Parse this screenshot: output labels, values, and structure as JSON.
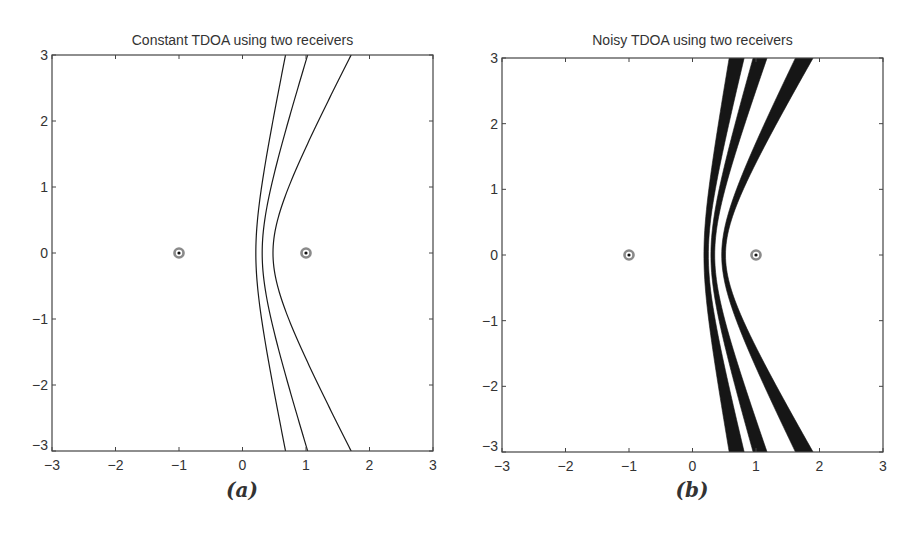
{
  "chart_data": [
    {
      "id": "a",
      "type": "line",
      "title": "Constant TDOA using two receivers",
      "caption": "(a)",
      "xlabel": "",
      "ylabel": "",
      "xlim": [
        -3,
        3
      ],
      "ylim": [
        -3,
        3
      ],
      "xticks": [
        -3,
        -2,
        -1,
        0,
        1,
        2,
        3
      ],
      "yticks": [
        -3,
        -2,
        -1,
        0,
        1,
        2,
        3
      ],
      "xtick_labels": [
        "−3",
        "−2",
        "−1",
        "0",
        "1",
        "2",
        "3"
      ],
      "ytick_labels": [
        "−3",
        "−2",
        "−1",
        "0",
        "1",
        "2",
        "3"
      ],
      "grid": false,
      "receivers": [
        {
          "x": -1,
          "y": 0
        },
        {
          "x": 1,
          "y": 0
        }
      ],
      "series": [
        {
          "name": "hyperbola-1",
          "kind": "curve",
          "vertex_x": 0.21,
          "x_at_y_pm3": 0.65
        },
        {
          "name": "hyperbola-2",
          "kind": "curve",
          "vertex_x": 0.31,
          "x_at_y_pm3": 1.0
        },
        {
          "name": "hyperbola-3",
          "kind": "curve",
          "vertex_x": 0.48,
          "x_at_y_pm3": 1.74
        }
      ]
    },
    {
      "id": "b",
      "type": "area",
      "title": "Noisy TDOA using two receivers",
      "caption": "(b)",
      "xlabel": "",
      "ylabel": "",
      "xlim": [
        -3,
        3
      ],
      "ylim": [
        -3,
        3
      ],
      "xticks": [
        -3,
        -2,
        -1,
        0,
        1,
        2,
        3
      ],
      "yticks": [
        -3,
        -2,
        -1,
        0,
        1,
        2,
        3
      ],
      "xtick_labels": [
        "−3",
        "−2",
        "−1",
        "0",
        "1",
        "2",
        "3"
      ],
      "ytick_labels": [
        "−3",
        "−2",
        "−1",
        "0",
        "1",
        "2",
        "3"
      ],
      "grid": false,
      "receivers": [
        {
          "x": -1,
          "y": 0
        },
        {
          "x": 1,
          "y": 0
        }
      ],
      "series": [
        {
          "name": "band-1",
          "kind": "band",
          "vertex_x": [
            0.18,
            0.25
          ],
          "x_at_y_pm3": [
            0.57,
            0.79
          ]
        },
        {
          "name": "band-2",
          "kind": "band",
          "vertex_x": [
            0.29,
            0.35
          ],
          "x_at_y_pm3": [
            0.96,
            1.18
          ]
        },
        {
          "name": "band-3",
          "kind": "band",
          "vertex_x": [
            0.46,
            0.52
          ],
          "x_at_y_pm3": [
            1.62,
            1.93
          ]
        }
      ]
    }
  ],
  "colors": {
    "curve": "#1a1a1a",
    "band": "#161616",
    "axis": "#444444",
    "receiver_ring": "#8a8a8a",
    "receiver_dot": "#111111"
  }
}
